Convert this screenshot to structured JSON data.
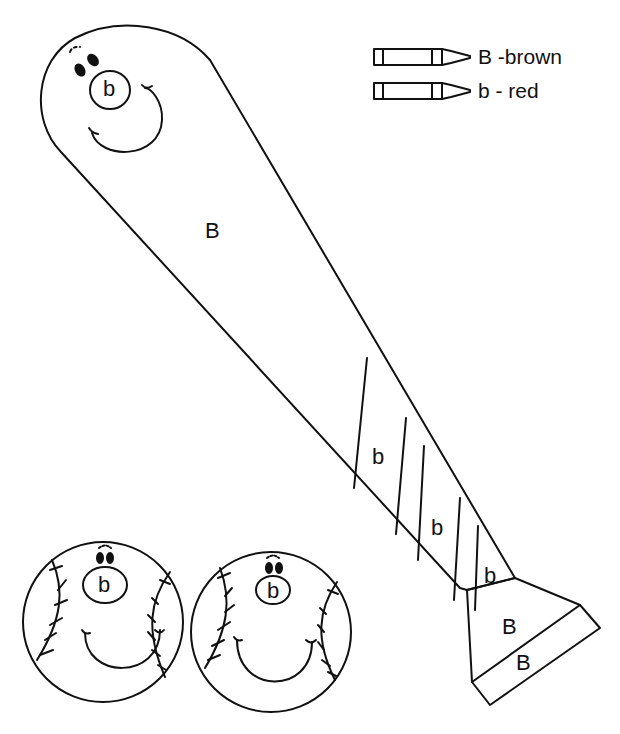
{
  "worksheet": {
    "legend": [
      {
        "code": "B",
        "separator": "-",
        "color_name": "brown",
        "text": "B -brown",
        "color": "#8B4513"
      },
      {
        "code": "b",
        "separator": "-",
        "color_name": "red",
        "text": "b - red",
        "color": "#D32F2F"
      }
    ],
    "bat": {
      "head_nose_label": "b",
      "body_label": "B",
      "stripe_labels": [
        "b",
        "b",
        "b"
      ],
      "knob_labels": [
        "B",
        "B"
      ]
    },
    "balls": [
      {
        "nose_label": "b"
      },
      {
        "nose_label": "b"
      }
    ]
  }
}
